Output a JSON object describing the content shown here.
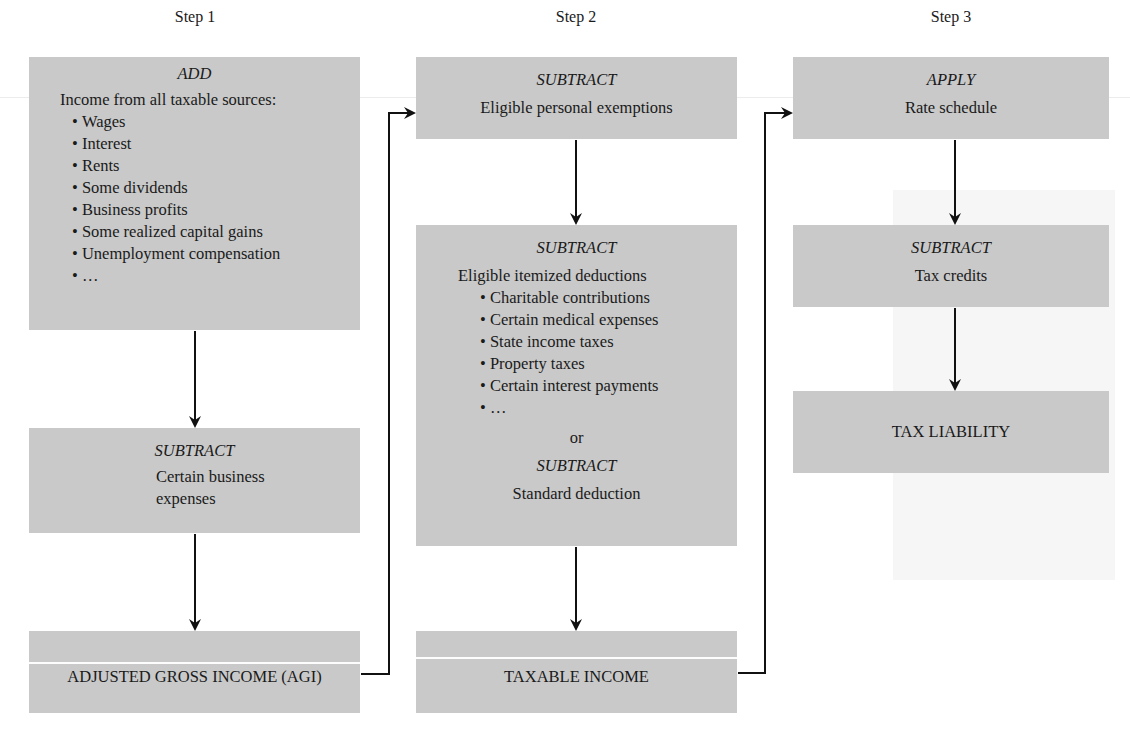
{
  "diagram": {
    "steps": [
      {
        "label": "Step 1",
        "boxes": [
          {
            "verb": "ADD",
            "description": "Income from all taxable sources:",
            "items": [
              "Wages",
              "Interest",
              "Rents",
              "Some dividends",
              "Business profits",
              "Some realized capital gains",
              "Unemployment compensation",
              "…"
            ]
          },
          {
            "verb": "SUBTRACT",
            "description_lines": [
              "Certain business",
              "expenses"
            ]
          },
          {
            "result": "ADJUSTED GROSS INCOME (AGI)"
          }
        ]
      },
      {
        "label": "Step 2",
        "boxes": [
          {
            "verb": "SUBTRACT",
            "description": "Eligible personal exemptions"
          },
          {
            "verb": "SUBTRACT",
            "description": "Eligible itemized deductions",
            "items": [
              "Charitable contributions",
              "Certain medical expenses",
              "State income taxes",
              "Property taxes",
              "Certain interest payments",
              "…"
            ],
            "or_label": "or",
            "alt_verb": "SUBTRACT",
            "alt_description": "Standard deduction"
          },
          {
            "result": "TAXABLE INCOME"
          }
        ]
      },
      {
        "label": "Step 3",
        "boxes": [
          {
            "verb": "APPLY",
            "description": "Rate schedule"
          },
          {
            "verb": "SUBTRACT",
            "description": "Tax credits"
          },
          {
            "result": "TAX LIABILITY"
          }
        ]
      }
    ],
    "colors": {
      "box_fill": "#c9c9c9",
      "arrow": "#111111",
      "background": "#ffffff"
    }
  }
}
